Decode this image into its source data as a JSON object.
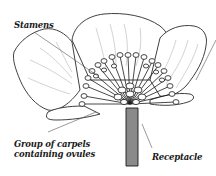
{
  "diagram": {
    "labels": {
      "stamens": "Stamens",
      "carpels_line1": "Group of carpels",
      "carpels_line2": "containing ovules",
      "receptacle": "Receptacle"
    },
    "colors": {
      "outline": "#2a2a2a",
      "vein": "#b5b5b5",
      "stem": "#8a8a8a",
      "leader_line": "#555555",
      "background": "#ffffff"
    }
  }
}
